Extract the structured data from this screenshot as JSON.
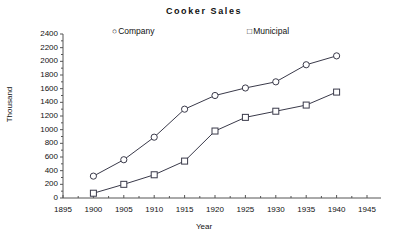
{
  "chart_data": {
    "type": "line",
    "title": "Cooker  Sales",
    "xlabel": "Year",
    "ylabel": "Thousand",
    "x": [
      1900,
      1905,
      1910,
      1915,
      1920,
      1925,
      1930,
      1935,
      1940
    ],
    "series": [
      {
        "name": "Company",
        "marker": "circle",
        "values": [
          320,
          560,
          890,
          1300,
          1500,
          1610,
          1700,
          1950,
          2080
        ]
      },
      {
        "name": "Municipal",
        "marker": "square",
        "values": [
          70,
          200,
          340,
          540,
          980,
          1180,
          1270,
          1360,
          1550
        ]
      }
    ],
    "xlim": [
      1895,
      1945
    ],
    "ylim": [
      0,
      2400
    ],
    "xticks": [
      1895,
      1900,
      1905,
      1910,
      1915,
      1920,
      1925,
      1930,
      1935,
      1940,
      1945
    ],
    "yticks": [
      0,
      200,
      400,
      600,
      800,
      1000,
      1200,
      1400,
      1600,
      1800,
      2000,
      2200,
      2400
    ],
    "xtick_labels": [
      "1895",
      "1900",
      "1905",
      "1910",
      "1915",
      "1920",
      "1925",
      "1930",
      "1935",
      "1940",
      "1945"
    ],
    "ytick_labels": [
      "0",
      "200",
      "400",
      "600",
      "800",
      "1000",
      "1200",
      "1400",
      "1600",
      "1800",
      "2000",
      "2200",
      "2400"
    ],
    "grid": false,
    "legend_position": "top",
    "line_color": "#3a3a4a",
    "marker_fill": "#ffffff",
    "axis_color": "#555555"
  },
  "legend": {
    "company_marker": "circle-marker-icon",
    "company_glyph": "○",
    "company_label": "Company",
    "municipal_marker": "square-marker-icon",
    "municipal_glyph": "□",
    "municipal_label": "Municipal"
  }
}
